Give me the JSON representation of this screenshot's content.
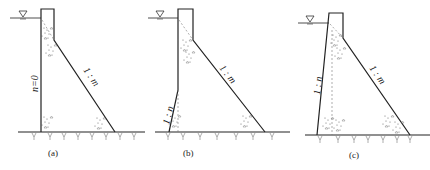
{
  "figure": {
    "panels": [
      {
        "id": "a",
        "caption": "(a)",
        "upstream_label": "n=0",
        "downstream_label": "1 : m"
      },
      {
        "id": "b",
        "caption": "(b)",
        "upstream_label": "1 : n",
        "downstream_label": "1 : m"
      },
      {
        "id": "c",
        "caption": "(c)",
        "upstream_label": "1 : n",
        "downstream_label": "1 : m"
      }
    ],
    "water_level_symbol": "▽",
    "line_color": "#222222",
    "aggregate_color": "#555555"
  }
}
